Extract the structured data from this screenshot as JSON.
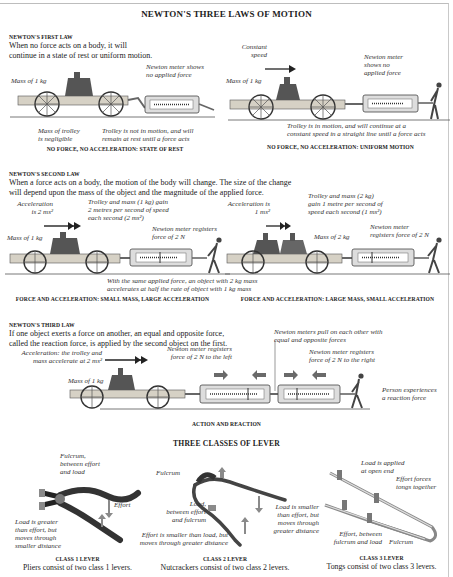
{
  "page_title": "NEWTON'S THREE LAWS OF MOTION",
  "first_law": {
    "heading": "NEWTON'S FIRST LAW",
    "text_line1": "When no force acts on a body, it will",
    "text_line2": "continue in a state of rest or uniform motion.",
    "rest": {
      "mass_label": "Mass of 1 kg",
      "meter_label_line1": "Newton meter shows",
      "meter_label_line2": "no applied force",
      "trolley_mass_line1": "Mass of trolley",
      "trolley_mass_line2": "is negligible",
      "state_line1": "Trolley is not in motion, and will",
      "state_line2": "remain at rest until a force acts",
      "caption": "NO FORCE, NO ACCELERATION: STATE OF REST"
    },
    "uniform": {
      "speed_line1": "Constant",
      "speed_line2": "speed",
      "mass_label": "Mass of 1 kg",
      "meter_label_line1": "Newton meter",
      "meter_label_line2": "shows no",
      "meter_label_line3": "applied force",
      "state_line1": "Trolley is in motion, and will continue at a",
      "state_line2": "constant speed in a straight line until a force acts",
      "caption": "NO FORCE, NO ACCELERATION: UNIFORM MOTION"
    }
  },
  "second_law": {
    "heading": "NEWTON'S SECOND LAW",
    "text_line1": "When a force acts on a body, the motion of the body will change. The size of the change",
    "text_line2": "will depend upon the mass of the object and the magnitude of the applied force.",
    "small_mass": {
      "accel_line1": "Acceleration",
      "accel_line2": "is 2 ms²",
      "gain_line1": "Trolley and mass (1 kg) gain",
      "gain_line2": "2 metres per second of speed",
      "gain_line3": "each second (2 ms²)",
      "mass_label": "Mass of 1 kg",
      "meter_line1": "Newton meter registers",
      "meter_line2": "force of 2 N",
      "caption": "FORCE AND ACCELERATION: SMALL MASS, LARGE ACCELERATION"
    },
    "shared_note_line1": "With the same applied force, an object with 2 kg mass",
    "shared_note_line2": "accelerates at half the rate of object with 1 kg mass",
    "large_mass": {
      "accel_line1": "Acceleration is",
      "accel_line2": "1 ms²",
      "gain_line1": "Trolley and mass (2 kg)",
      "gain_line2": "gain 1 metre per second of",
      "gain_line3": "speed each second (1 ms²)",
      "mass_label": "Mass of 2 kg",
      "meter_line1": "Newton meter",
      "meter_line2": "registers force of 2 N",
      "caption": "FORCE AND ACCELERATION: LARGE MASS, SMALL ACCELERATION"
    }
  },
  "third_law": {
    "heading": "NEWTON'S THIRD LAW",
    "text_line1": "If one object exerts a force on another, an equal and opposite force,",
    "text_line2": "called the reaction force, is applied by the second object on the first.",
    "accel_line1": "Acceleration: the trolley and",
    "accel_line2": "mass accelerate at 2 ms²",
    "mass_label": "Mass of 1 kg",
    "left_meter_line1": "Newton meter registers",
    "left_meter_line2": "force of 2 N to the left",
    "pull_line1": "Newton meters pull on each other with",
    "pull_line2": "equal and opposite forces",
    "right_meter_line1": "Newton meter registers",
    "right_meter_line2": "force of 2 N to the right",
    "person_line1": "Person experiences",
    "person_line2": "a reaction force",
    "caption": "ACTION AND REACTION"
  },
  "levers": {
    "title": "THREE CLASSES OF LEVER",
    "class1": {
      "fulcrum_line1": "Fulcrum,",
      "fulcrum_line2": "between effort",
      "fulcrum_line3": "and load",
      "effort": "Effort",
      "load_line1": "Load is greater",
      "load_line2": "than effort, but",
      "load_line3": "moves through",
      "load_line4": "smaller distance",
      "caption": "CLASS 1 LEVER",
      "subcaption": "Pliers consist of two class 1 levers."
    },
    "class2": {
      "fulcrum": "Fulcrum",
      "load_line1": "Load,",
      "load_line2": "between effort",
      "load_line3": "and fulcrum",
      "effort_line1": "Effort is smaller than load, but",
      "effort_line2": "moves through greater distance",
      "load2_line1": "Load is smaller",
      "load2_line2": "than effort, but",
      "load2_line3": "moves through",
      "load2_line4": "greater distance",
      "caption": "CLASS 2 LEVER",
      "subcaption": "Nutcrackers consist of two class 2 levers."
    },
    "class3": {
      "load_line1": "Load is applied",
      "load_line2": "at open end",
      "effort_line1": "Effort forces",
      "effort_line2": "tongs together",
      "between_line1": "Effort, between",
      "between_line2": "fulcrum and load",
      "fulcrum": "Fulcrum",
      "caption": "CLASS 3 LEVER",
      "subcaption": "Tongs consist of two class 3 levers."
    }
  },
  "colors": {
    "ink": "#222222",
    "metal": "#7d7d7d",
    "wood": "#c9c4b8",
    "arrow": "#6a6a6a",
    "frame": "#bdbdbd"
  }
}
